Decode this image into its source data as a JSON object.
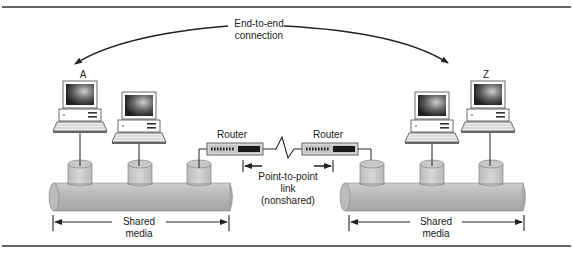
{
  "diagram": {
    "top_label_line1": "End-to-end",
    "top_label_line2": "connection",
    "endpoint_a": "A",
    "endpoint_z": "Z",
    "router_left": "Router",
    "router_right": "Router",
    "link_line1": "Point-to-point",
    "link_line2": "link",
    "link_line3": "(nonshared)",
    "shared_left_line1": "Shared",
    "shared_left_line2": "media",
    "shared_right_line1": "Shared",
    "shared_right_line2": "media"
  },
  "colors": {
    "pipe": "#b5b5b5",
    "pipe_light": "#d2d2d2",
    "line": "#222222",
    "screen": "#3a3a3a"
  }
}
